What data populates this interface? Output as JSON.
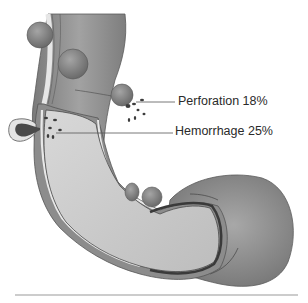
{
  "diagram": {
    "labels": [
      {
        "id": "perforation",
        "text": "Perforation 18%"
      },
      {
        "id": "hemorrhage",
        "text": "Hemorrhage 25%"
      }
    ],
    "colors": {
      "outer_wall": "#8a8a8a",
      "outer_wall_dark": "#6e6e6e",
      "lumen": "#c8c8c8",
      "lumen_light": "#dcdcdc",
      "mucosa_line": "#4a4a4a",
      "diverticulum": "#7d7d7d",
      "blood": "#3c3c3c",
      "leader_line": "#555555",
      "baseline": "#999999"
    }
  }
}
